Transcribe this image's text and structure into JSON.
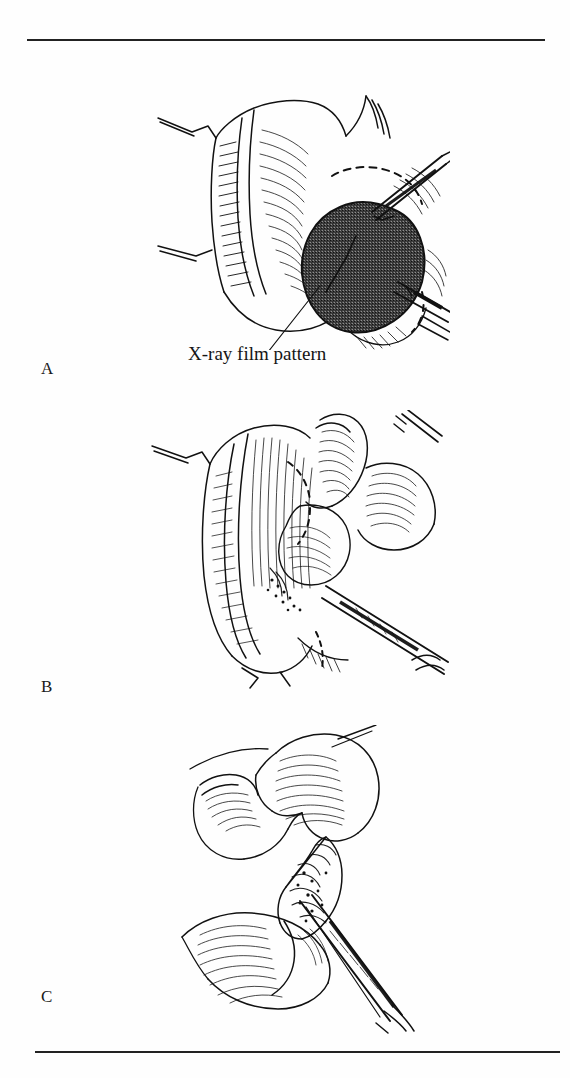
{
  "page": {
    "background_color": "#fefefe",
    "ink_color": "#111111",
    "width": 570,
    "height": 1078,
    "kind": "surgical-technique-illustration-plate",
    "medium": "pen-and-ink line drawing"
  },
  "rules": {
    "top": {
      "label": "top-rule"
    },
    "bottom": {
      "label": "bottom-rule"
    }
  },
  "panels": [
    {
      "letter": "A",
      "caption": "",
      "description": "Retracted surgical wound held open with stay sutures; a dark stippled oval marks the X-ray film pattern traced on the exposed tissue. Forceps and a clamp enter from the upper and lower right.",
      "annotation": "X-ray film pattern"
    },
    {
      "letter": "B",
      "caption": "",
      "description": "Dissection of the flap with the surgeon's fingers retracting tissue while a clamp and scissors work in the depth of the wound. Dashed lines indicate the incision outline.",
      "annotation": ""
    },
    {
      "letter": "C",
      "caption": "",
      "description": "Two fingers grasp the pedicle while long scissors divide the remaining attachment.",
      "annotation": ""
    }
  ],
  "annotations": {
    "xray_film_pattern": {
      "text": "X-ray film pattern",
      "leader_from": {
        "x": 290,
        "y": 238
      },
      "leader_to": {
        "x": 236,
        "y": 336
      }
    }
  },
  "colors": {
    "ink": "#111111",
    "rule": "#222222",
    "stipple_dark": "#3a3a3a",
    "paper": "#fefefe"
  }
}
